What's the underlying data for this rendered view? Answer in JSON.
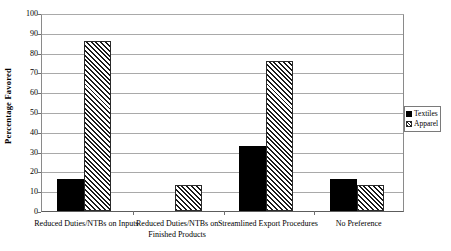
{
  "chart_data": {
    "type": "bar",
    "title": "",
    "subtitle": "",
    "xlabel": "",
    "ylabel": "Percentage Favored",
    "ylim": [
      0,
      100
    ],
    "ytick_step": 10,
    "yticks": [
      0,
      10,
      20,
      30,
      40,
      50,
      60,
      70,
      80,
      90,
      100
    ],
    "grid": true,
    "legend_position": "right",
    "categories": [
      "Reduced Duties/NTBs on Inputs",
      "Reduced Duties/NTBs on Finished Products",
      "Streamlined Export Procedures",
      "No Preference"
    ],
    "category_lines": [
      [
        "Reduced Duties/NTBs on Inputs"
      ],
      [
        "Reduced Duties/NTBs on",
        "Finished Products"
      ],
      [
        "Streamlined Export Procedures"
      ],
      [
        "No Preference"
      ]
    ],
    "series": [
      {
        "name": "Textiles",
        "fill": "solid-black",
        "color": "#000000",
        "values": [
          16,
          0,
          33,
          16
        ]
      },
      {
        "name": "Apparel",
        "fill": "diagonal-hatch",
        "color": "#1a1a1a",
        "values": [
          86,
          13,
          76,
          13
        ]
      }
    ],
    "annotations": []
  },
  "legend": {
    "items": [
      {
        "label": "Textiles"
      },
      {
        "label": "Apparel"
      }
    ]
  },
  "colors": {
    "background": "#ffffff",
    "axis": "#5c5c5c",
    "gridline": "#a9a9a9",
    "text": "#000000"
  }
}
